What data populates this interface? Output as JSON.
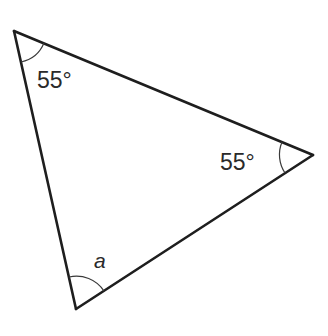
{
  "diagram": {
    "type": "triangle",
    "vertices": {
      "top_left": {
        "x": 14,
        "y": 31
      },
      "right": {
        "x": 313,
        "y": 155
      },
      "bottom": {
        "x": 76,
        "y": 309
      }
    },
    "angles": {
      "top_left": {
        "label": "55°",
        "value_degrees": 55
      },
      "right": {
        "label": "55°",
        "value_degrees": 55
      },
      "bottom": {
        "label": "a",
        "unknown": true
      }
    },
    "stroke_color": "#1e1e1e",
    "arc_color": "#3a3a3a",
    "text_color": "#2a2a2a",
    "background": "#ffffff"
  }
}
